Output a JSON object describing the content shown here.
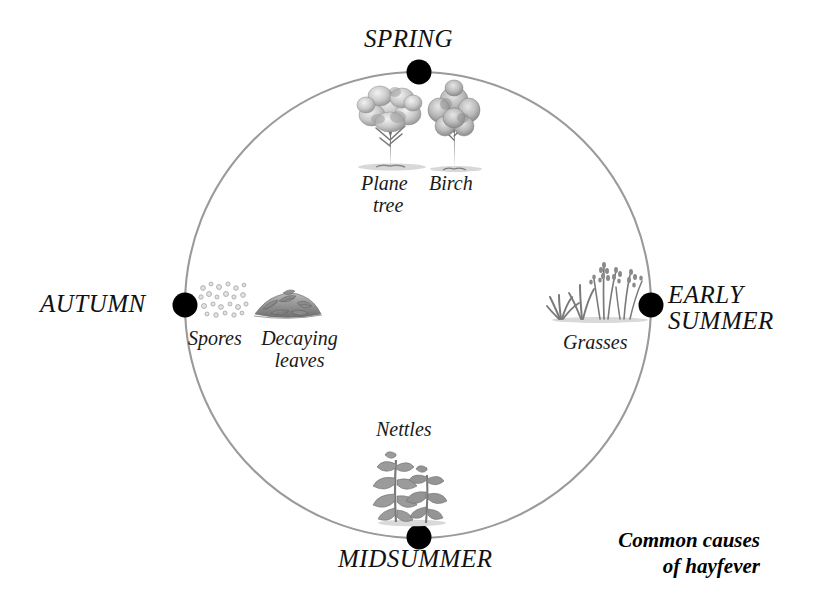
{
  "diagram": {
    "caption_line1": "Common causes",
    "caption_line2": "of hayfever",
    "caption_full": "Common causes\nof hayfever",
    "type": "seasonal cycle diagram",
    "circle": {
      "center_x": 418,
      "center_y": 305,
      "radius": 233,
      "stroke_color": "#9a9a9a",
      "node_color": "#000000",
      "node_radius": 12
    },
    "seasons": [
      {
        "id": "spring",
        "label": "SPRING",
        "position": "top",
        "angle_deg": 90,
        "node_x": 419,
        "node_y": 72,
        "causes": [
          "Plane tree",
          "Birch"
        ]
      },
      {
        "id": "early-summer",
        "label": "EARLY\nSUMMER",
        "label_line1": "EARLY",
        "label_line2": "SUMMER",
        "position": "right",
        "angle_deg": 0,
        "node_x": 651,
        "node_y": 305,
        "causes": [
          "Grasses"
        ]
      },
      {
        "id": "midsummer",
        "label": "MIDSUMMER",
        "position": "bottom",
        "angle_deg": 270,
        "node_x": 419,
        "node_y": 537,
        "causes": [
          "Nettles"
        ]
      },
      {
        "id": "autumn",
        "label": "AUTUMN",
        "position": "left",
        "angle_deg": 180,
        "node_x": 185,
        "node_y": 305,
        "causes": [
          "Spores",
          "Decaying leaves"
        ]
      }
    ],
    "labels": {
      "plane_tree_line1": "Plane",
      "plane_tree_line2": "tree",
      "birch": "Birch",
      "grasses": "Grasses",
      "nettles": "Nettles",
      "spores": "Spores",
      "decaying_leaves_line1": "Decaying",
      "decaying_leaves_line2": "leaves"
    },
    "illustrations": [
      {
        "id": "plane-tree-illustration",
        "name": "plane tree",
        "season": "spring"
      },
      {
        "id": "birch-tree-illustration",
        "name": "birch tree",
        "season": "spring"
      },
      {
        "id": "grasses-illustration",
        "name": "grasses",
        "season": "early-summer"
      },
      {
        "id": "nettles-illustration",
        "name": "nettles",
        "season": "midsummer"
      },
      {
        "id": "spores-illustration",
        "name": "spores",
        "season": "autumn"
      },
      {
        "id": "decaying-leaves-illustration",
        "name": "decaying leaves",
        "season": "autumn"
      }
    ]
  }
}
